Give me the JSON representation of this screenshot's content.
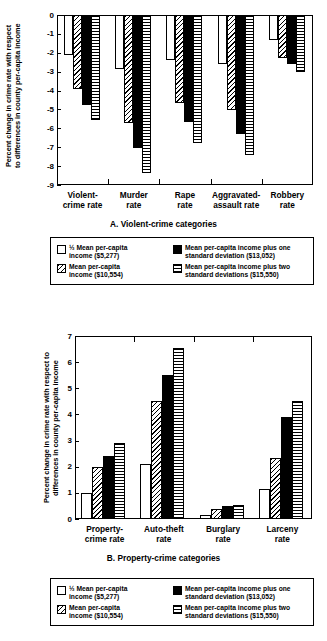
{
  "figure": {
    "legend_items": [
      {
        "key": "half_mean",
        "pattern": "open",
        "label": "½ Mean per-capita\nincome ($5,277)"
      },
      {
        "key": "mean",
        "pattern": "diagonal-hatch",
        "label": "Mean per-capita\nincome ($10,554)"
      },
      {
        "key": "plus_one_sd",
        "pattern": "solid-black",
        "label": "Mean per-capita income plus one\nstandard deviation ($13,052)"
      },
      {
        "key": "plus_two_sd",
        "pattern": "horizontal-lines",
        "label": "Mean per-capita income plus two\nstandard deviations ($15,550)"
      }
    ]
  },
  "chart_data": [
    {
      "id": "panel-a",
      "type": "bar",
      "title": "A. Violent-crime categories",
      "xlabel": "",
      "ylabel": "Percent change in crime rate with respect\nto differences in county per-capita income",
      "ylim": [
        -9,
        0
      ],
      "yticks": [
        0,
        -1,
        -2,
        -3,
        -4,
        -5,
        -6,
        -7,
        -8,
        -9
      ],
      "ytick_labels": [
        "0",
        "-1",
        "-2",
        "-3",
        "-4",
        "-5",
        "-6",
        "-7",
        "-8",
        "-9"
      ],
      "grid": false,
      "legend_position": "below",
      "categories": [
        "Violent-\ncrime rate",
        "Murder\nrate",
        "Rape\nrate",
        "Aggravated-\nassault rate",
        "Robbery\nrate"
      ],
      "series": [
        {
          "name": "½ Mean per-capita income ($5,277)",
          "pattern": "open",
          "values": [
            -2.1,
            -2.85,
            -2.4,
            -2.6,
            -1.3
          ]
        },
        {
          "name": "Mean per-capita income ($10,554)",
          "pattern": "diagonal-hatch",
          "values": [
            -3.9,
            -5.7,
            -4.65,
            -5.05,
            -2.3
          ]
        },
        {
          "name": "Mean per-capita income plus one standard deviation ($13,052)",
          "pattern": "solid-black",
          "values": [
            -4.75,
            -7.05,
            -5.65,
            -6.3,
            -2.6
          ]
        },
        {
          "name": "Mean per-capita income plus two standard deviations ($15,550)",
          "pattern": "horizontal-lines",
          "values": [
            -5.55,
            -8.35,
            -6.75,
            -7.4,
            -3.0
          ]
        }
      ]
    },
    {
      "id": "panel-b",
      "type": "bar",
      "title": "B. Property-crime categories",
      "xlabel": "",
      "ylabel": "Percent change in crime rate with respect to\ndifferences in county per-capita income",
      "ylim": [
        0,
        7
      ],
      "yticks": [
        7,
        6,
        5,
        4,
        3,
        2,
        1,
        0
      ],
      "ytick_labels": [
        "7",
        "6",
        "5",
        "4",
        "3",
        "2",
        "1",
        "0"
      ],
      "grid": false,
      "legend_position": "below",
      "categories": [
        "Property-\ncrime rate",
        "Auto-theft\nrate",
        "Burglary\nrate",
        "Larceny\nrate"
      ],
      "series": [
        {
          "name": "½ Mean per-capita income ($5,277)",
          "pattern": "open",
          "values": [
            1.0,
            2.1,
            0.17,
            1.13
          ]
        },
        {
          "name": "Mean per-capita income ($10,554)",
          "pattern": "diagonal-hatch",
          "values": [
            2.0,
            4.52,
            0.37,
            2.32
          ]
        },
        {
          "name": "Mean per-capita income plus one standard deviation ($13,052)",
          "pattern": "solid-black",
          "values": [
            2.4,
            5.5,
            0.48,
            3.9
          ]
        },
        {
          "name": "Mean per-capita income plus two standard deviations ($15,550)",
          "pattern": "horizontal-lines",
          "values": [
            2.92,
            6.55,
            0.55,
            4.52
          ]
        }
      ]
    }
  ]
}
